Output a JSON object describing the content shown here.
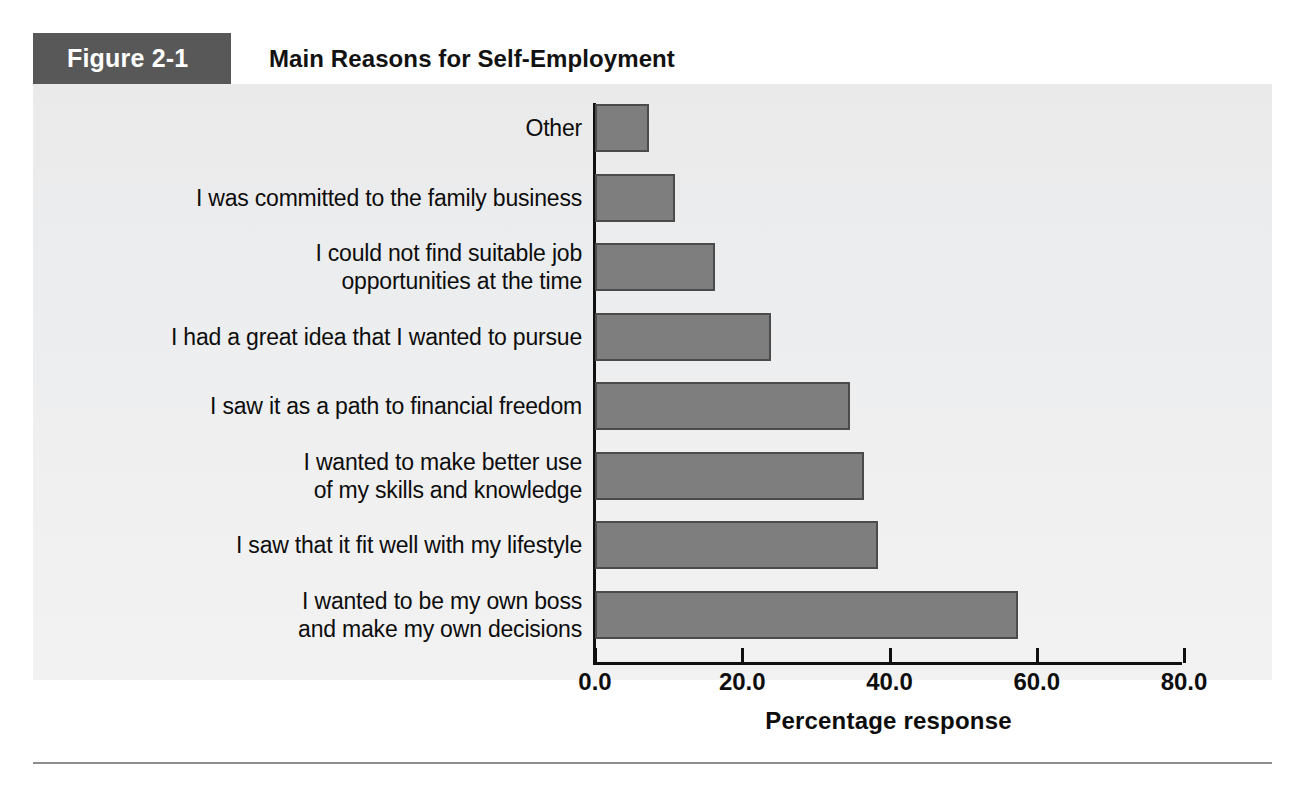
{
  "figure": {
    "tag": "Figure 2-1",
    "title": "Main Reasons for Self-Employment"
  },
  "colors": {
    "tag_background": "#585858",
    "panel_background": "#ededee",
    "bar_fill": "#7e7e7e",
    "bar_outline": "#4b4b4b",
    "axis": "#101010",
    "text": "#0d0d0d",
    "rule": "#8d8d8d"
  },
  "chart_data": {
    "type": "bar",
    "orientation": "horizontal",
    "title": "Main Reasons for Self-Employment",
    "xlabel": "Percentage response",
    "ylabel": "",
    "xlim": [
      0.0,
      80.0
    ],
    "xticks": [
      "0.0",
      "20.0",
      "40.0",
      "60.0",
      "80.0"
    ],
    "xtick_values": [
      0,
      20,
      40,
      60,
      80
    ],
    "grid": false,
    "legend": false,
    "categories": [
      "Other",
      "I was committed to the family business",
      "I could not find suitable job\nopportunities at the time",
      "I had a great idea that I wanted to pursue",
      "I saw it as a path to financial freedom",
      "I wanted to make better use\nof my skills and knowledge",
      "I saw that it fit well with my lifestyle",
      "I wanted to be my own boss\nand make my own decisions"
    ],
    "values": [
      7.3,
      10.9,
      16.3,
      23.9,
      34.6,
      36.5,
      38.4,
      57.5
    ]
  }
}
